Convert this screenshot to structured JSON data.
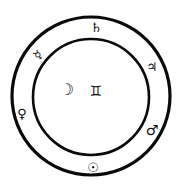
{
  "diagram": {
    "type": "astrological-seal",
    "ink_color": "#0a0a0a",
    "background": "#ffffff",
    "outer_circle": {
      "cx": 91,
      "cy": 96,
      "r": 79,
      "stroke_width": 3.2
    },
    "inner_circle": {
      "cx": 91,
      "cy": 97,
      "r": 58,
      "stroke_width": 2.6
    },
    "center": {
      "planet": {
        "name": "Moon",
        "symbol": "☽"
      },
      "sign": {
        "name": "Gemini",
        "symbol": "♊"
      }
    },
    "ring_symbols": [
      {
        "name": "Saturn",
        "symbol": "♄",
        "position": "top"
      },
      {
        "name": "Jupiter",
        "symbol": "♃",
        "position": "upper-right"
      },
      {
        "name": "Mars",
        "symbol": "♂",
        "position": "lower-right"
      },
      {
        "name": "Sun",
        "symbol": "☉",
        "position": "bottom"
      },
      {
        "name": "Venus",
        "symbol": "♀",
        "position": "left"
      },
      {
        "name": "Mercury",
        "symbol": "☿",
        "position": "upper-left"
      }
    ]
  }
}
